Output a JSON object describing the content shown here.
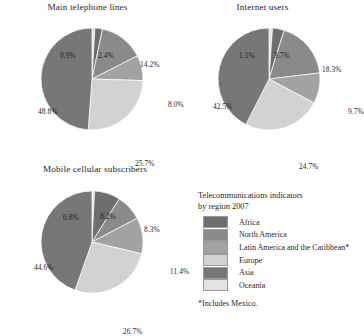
{
  "figure": {
    "background": "#ffffff",
    "text_color": "#1f1f1f"
  },
  "legend": {
    "title_line1": "Telecommunications indicators",
    "title_line2": "by region 2007",
    "note": "*Includes Mexico.",
    "entries": [
      {
        "label": "Africa",
        "color": "#6e6e6e"
      },
      {
        "label": "North America",
        "color": "#8a8a8a"
      },
      {
        "label": "Latin America and the Caribbean*",
        "color": "#a2a2a2"
      },
      {
        "label": "Europe",
        "color": "#d2d2d2"
      },
      {
        "label": "Asia",
        "color": "#777777"
      },
      {
        "label": "Oceania",
        "color": "#e3e3e3"
      }
    ]
  },
  "chart_data": [
    {
      "type": "pie",
      "title": "Main telephone lines",
      "categories": [
        "Oceania",
        "Africa",
        "North America",
        "Latin America and the Caribbean",
        "Europe",
        "Asia"
      ],
      "values": [
        0.9,
        2.4,
        14.2,
        8.0,
        25.7,
        48.8
      ],
      "labels": [
        "0.9%",
        "2.4%",
        "14.2%",
        "8.0%",
        "25.7%",
        "48.8%"
      ],
      "colors": [
        "#e3e3e3",
        "#6e6e6e",
        "#8a8a8a",
        "#a2a2a2",
        "#d2d2d2",
        "#777777"
      ],
      "start_angle_deg": 0,
      "direction": "clockwise",
      "units": "percent"
    },
    {
      "type": "pie",
      "title": "Internet users",
      "categories": [
        "Oceania",
        "Africa",
        "North America",
        "Latin America and the Caribbean",
        "Europe",
        "Asia"
      ],
      "values": [
        1.1,
        3.7,
        18.3,
        9.7,
        24.7,
        42.5
      ],
      "labels": [
        "1.1%",
        "3.7%",
        "18.3%",
        "9.7%",
        "24.7%",
        "42.5%"
      ],
      "colors": [
        "#e3e3e3",
        "#6e6e6e",
        "#8a8a8a",
        "#a2a2a2",
        "#d2d2d2",
        "#777777"
      ],
      "start_angle_deg": 0,
      "direction": "clockwise",
      "units": "percent"
    },
    {
      "type": "pie",
      "title": "Mobile cellular subscribers",
      "categories": [
        "Oceania",
        "Africa",
        "North America",
        "Latin America and the Caribbean",
        "Europe",
        "Asia"
      ],
      "values": [
        0.8,
        8.2,
        8.3,
        11.4,
        26.7,
        44.6
      ],
      "labels": [
        "0.8%",
        "8.2%",
        "8.3%",
        "11.4%",
        "26.7%",
        "44.6%"
      ],
      "colors": [
        "#e3e3e3",
        "#6e6e6e",
        "#8a8a8a",
        "#a2a2a2",
        "#d2d2d2",
        "#777777"
      ],
      "start_angle_deg": 0,
      "direction": "clockwise",
      "units": "percent"
    }
  ],
  "pie_label_positions": {
    "telephone": [
      {
        "x": 20,
        "y": 24,
        "anchor": "start"
      },
      {
        "x": 58,
        "y": 24,
        "anchor": "start"
      },
      {
        "x": 100,
        "y": 33,
        "anchor": "start"
      },
      {
        "x": 128,
        "y": 73,
        "anchor": "start"
      },
      {
        "x": 95,
        "y": 132,
        "anchor": "start"
      },
      {
        "x": -2,
        "y": 80,
        "anchor": "start"
      }
    ],
    "internet": [
      {
        "x": 22,
        "y": 24,
        "anchor": "start"
      },
      {
        "x": 57,
        "y": 24,
        "anchor": "start"
      },
      {
        "x": 105,
        "y": 38,
        "anchor": "start"
      },
      {
        "x": 131,
        "y": 80,
        "anchor": "start"
      },
      {
        "x": 82,
        "y": 135,
        "anchor": "start"
      },
      {
        "x": -4,
        "y": 75,
        "anchor": "start"
      }
    ],
    "mobile": [
      {
        "x": 23,
        "y": 23,
        "anchor": "start"
      },
      {
        "x": 60,
        "y": 22,
        "anchor": "start"
      },
      {
        "x": 104,
        "y": 35,
        "anchor": "start"
      },
      {
        "x": 130,
        "y": 77,
        "anchor": "start"
      },
      {
        "x": 83,
        "y": 137,
        "anchor": "start"
      },
      {
        "x": -6,
        "y": 73,
        "anchor": "start"
      }
    ]
  }
}
